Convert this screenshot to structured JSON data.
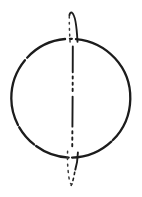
{
  "figure": {
    "name": "sphere-with-meridian-ellipse-engraving",
    "background": "#ffffff",
    "ink": "#1c1c1c",
    "ink_soft": "#3a3a3a",
    "canvas": {
      "width": 142,
      "height": 197
    },
    "sphere_outline": {
      "d": "M 70.7 38.8 C 104.2 39.3 130.9 65.6 130.3 98.9 C 129.7 131.6 103.3 157.3 71.2 157.6 C 39.6 157.9 11.6 131.3 11.3 98.6 C 11.0 65.8 37.8 38.3 70.7 38.8",
      "stroke_width": "2.3",
      "dasharray": "3 11 361 6 116 9 94 7 61 7 185 9 116 13 2"
    },
    "meridian": {
      "front_top_arc": {
        "d": "M 69.4 15.2 C 69.8 13.1 70.8 12.1 71.9 12.7 C 74.6 14.3 76.7 25.5 77.5 41.8",
        "stroke_width": "1.9",
        "dasharray": "none"
      },
      "back_top_arc": {
        "d": "M 69.3 16.5 C 69.2 23.5 69.5 34 70.3 45.5",
        "stroke_width": "1.5",
        "dasharray": "1.7 4.3"
      },
      "edge_axis": {
        "d": "M 72.8 46.5 C 72.8 70 72.5 120 72.2 151.5",
        "stroke_width": "1.9",
        "dasharray": "26 4 2.2 4 2.2 4 2.2 5.5 30 4.5 2.2 4.2 2.2 4.2 2.2 6"
      },
      "front_bottom_arc": {
        "d": "M 77.9 152.5 C 77.7 158.8 76.8 164.8 75.3 169.6",
        "stroke_width": "1.9",
        "dasharray": "none"
      },
      "front_bottom_tip": {
        "d": "M 74.7 172.2 C 73.8 177.6 72.8 181.6 71.2 185.3",
        "stroke_width": "1.6",
        "dasharray": "2.2 4"
      },
      "back_bottom_arc": {
        "d": "M 67.6 151.2 C 67.2 160.5 67.7 171 69.6 181.5 C 70.1 183.8 71.5 184.9 72.9 183.1",
        "stroke_width": "1.5",
        "dasharray": "1.9 4.6"
      }
    }
  }
}
